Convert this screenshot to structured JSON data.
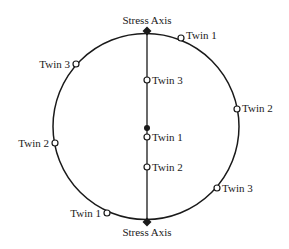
{
  "diagram": {
    "colors": {
      "stroke": "#1a1a1a",
      "background": "#ffffff"
    },
    "circle": {
      "cx": 146,
      "cy": 126.5,
      "r": 93
    },
    "stress_axis_line": {
      "x": 147,
      "y1": 31,
      "y2": 222
    },
    "stress_axis_labels": [
      {
        "id": "top",
        "text": "Stress Axis",
        "x": 147,
        "y": 24,
        "anchor": "middle"
      },
      {
        "id": "bottom",
        "text": "Stress Axis",
        "x": 147,
        "y": 236,
        "anchor": "middle"
      }
    ],
    "stress_axis_diamonds": [
      {
        "id": "top",
        "x": 147,
        "y": 31
      },
      {
        "id": "bottom",
        "x": 147,
        "y": 222
      }
    ],
    "center_dot": {
      "x": 147,
      "y": 128
    },
    "twin_markers": [
      {
        "id": "rim-twin1-top",
        "label": "Twin 1",
        "x": 181,
        "y": 38,
        "label_x": 186,
        "label_y": 39,
        "anchor": "start"
      },
      {
        "id": "rim-twin3-left",
        "label": "Twin 3",
        "x": 76,
        "y": 64,
        "label_x": 70,
        "label_y": 68,
        "anchor": "end"
      },
      {
        "id": "rim-twin2-right",
        "label": "Twin 2",
        "x": 237,
        "y": 109,
        "label_x": 242,
        "label_y": 112,
        "anchor": "start"
      },
      {
        "id": "rim-twin2-left",
        "label": "Twin 2",
        "x": 55,
        "y": 143,
        "label_x": 49,
        "label_y": 147,
        "anchor": "end"
      },
      {
        "id": "rim-twin3-right",
        "label": "Twin 3",
        "x": 217,
        "y": 188,
        "label_x": 222,
        "label_y": 192,
        "anchor": "start"
      },
      {
        "id": "rim-twin1-bottom",
        "label": "Twin 1",
        "x": 107,
        "y": 213,
        "label_x": 101,
        "label_y": 217,
        "anchor": "end"
      },
      {
        "id": "axis-twin3",
        "label": "Twin 3",
        "x": 147,
        "y": 80,
        "label_x": 152,
        "label_y": 84,
        "anchor": "start"
      },
      {
        "id": "axis-twin1",
        "label": "Twin 1",
        "x": 147,
        "y": 137,
        "label_x": 152,
        "label_y": 141,
        "anchor": "start"
      },
      {
        "id": "axis-twin2",
        "label": "Twin 2",
        "x": 147,
        "y": 167,
        "label_x": 152,
        "label_y": 171,
        "anchor": "start"
      }
    ]
  }
}
